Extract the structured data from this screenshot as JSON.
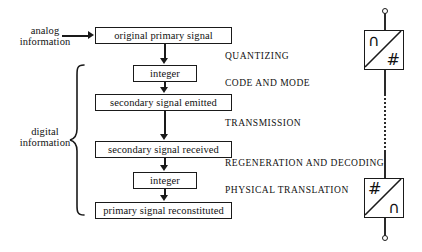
{
  "figure": {
    "type": "flow-diagram",
    "left_annotations": [
      {
        "id": "analog",
        "line1": "analog",
        "line2": "information"
      },
      {
        "id": "digital",
        "line1": "digital",
        "line2": "information"
      }
    ],
    "flow_boxes": [
      {
        "id": "original-primary-signal",
        "label": "original primary signal"
      },
      {
        "id": "integer-top",
        "label": "integer"
      },
      {
        "id": "secondary-signal-emitted",
        "label": "secondary signal emitted"
      },
      {
        "id": "secondary-signal-received",
        "label": "secondary signal received"
      },
      {
        "id": "integer-bottom",
        "label": "integer"
      },
      {
        "id": "primary-signal-reconstituted",
        "label": "primary signal reconstituted"
      }
    ],
    "stage_labels": [
      {
        "id": "quantizing",
        "label": "QUANTIZING"
      },
      {
        "id": "code-and-mode",
        "label": "CODE AND MODE"
      },
      {
        "id": "transmission",
        "label": "TRANSMISSION"
      },
      {
        "id": "regeneration-and-decoding",
        "label": "REGENERATION AND DECODING"
      },
      {
        "id": "physical-translation",
        "label": "PHYSICAL TRANSLATION"
      }
    ],
    "converter_symbols": [
      {
        "id": "adc-symbol",
        "upper_left_glyph": "∩",
        "lower_right_glyph": "#",
        "meaning": "analog-to-digital converter"
      },
      {
        "id": "dac-symbol",
        "upper_left_glyph": "#",
        "lower_right_glyph": "∩",
        "meaning": "digital-to-analog converter"
      }
    ],
    "colors": {
      "stroke": "#1a1a1a",
      "background": "#ffffff",
      "text": "#111111"
    }
  }
}
